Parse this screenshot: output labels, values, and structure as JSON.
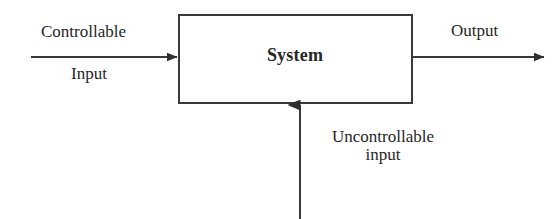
{
  "diagram": {
    "title_block": {
      "label": "System",
      "shape": "rectangle"
    },
    "inputs": {
      "controllable": {
        "line1": "Controllable",
        "line2": "Input",
        "arrow": "left-to-right-arrow"
      },
      "uncontrollable": {
        "line1": "Uncontrollable",
        "line2": "input",
        "arrow": "bottom-to-top-arrow"
      }
    },
    "outputs": {
      "primary": {
        "label": "Output",
        "arrow": "left-to-right-arrow"
      }
    },
    "colors": {
      "background": "#ffffff",
      "stroke": "#3a3a3a",
      "text": "#262626"
    }
  }
}
